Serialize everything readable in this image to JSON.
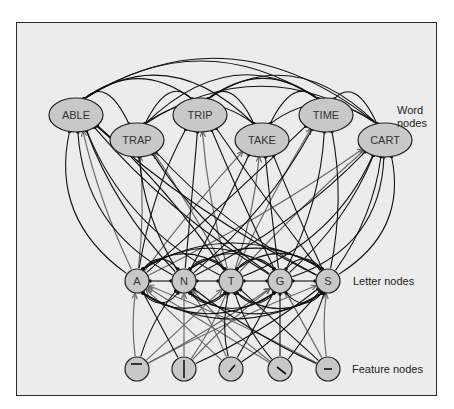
{
  "diagram": {
    "colors": {
      "background": "#ececec",
      "node_fill": "#c8c8c8",
      "excitatory": "#6a6a6a",
      "inhibitory": "#111111",
      "frame": "#2a2a2a"
    },
    "labels": {
      "word_nodes": "Word\nnodes",
      "word_line1": "Word",
      "word_line2": "nodes",
      "letter_nodes": "Letter nodes",
      "feature_nodes": "Feature nodes"
    },
    "word_nodes": [
      {
        "id": "ABLE",
        "label": "ABLE",
        "x": 76,
        "y": 115
      },
      {
        "id": "TRIP",
        "label": "TRIP",
        "x": 200,
        "y": 115
      },
      {
        "id": "TIME",
        "label": "TIME",
        "x": 326,
        "y": 115
      },
      {
        "id": "TRAP",
        "label": "TRAP",
        "x": 137,
        "y": 140
      },
      {
        "id": "TAKE",
        "label": "TAKE",
        "x": 262,
        "y": 140
      },
      {
        "id": "CART",
        "label": "CART",
        "x": 385,
        "y": 140
      }
    ],
    "letter_nodes": [
      {
        "id": "A",
        "label": "A",
        "x": 137,
        "y": 281
      },
      {
        "id": "N",
        "label": "N",
        "x": 184,
        "y": 281
      },
      {
        "id": "T",
        "label": "T",
        "x": 231,
        "y": 281
      },
      {
        "id": "G",
        "label": "G",
        "x": 280,
        "y": 281
      },
      {
        "id": "S",
        "label": "S",
        "x": 328,
        "y": 281
      }
    ],
    "feature_nodes": [
      {
        "id": "f1",
        "glyph": "horizontal-top",
        "x": 137,
        "y": 369
      },
      {
        "id": "f2",
        "glyph": "vertical",
        "x": 184,
        "y": 369
      },
      {
        "id": "f3",
        "glyph": "diagonal-right",
        "x": 231,
        "y": 369
      },
      {
        "id": "f4",
        "glyph": "diagonal-left",
        "x": 280,
        "y": 369
      },
      {
        "id": "f5",
        "glyph": "horizontal-middle",
        "x": 328,
        "y": 369
      }
    ],
    "connections": {
      "feature_to_letter_excitatory": [
        [
          "f1",
          "A"
        ],
        [
          "f1",
          "T"
        ],
        [
          "f1",
          "G"
        ],
        [
          "f1",
          "S"
        ],
        [
          "f2",
          "N"
        ],
        [
          "f2",
          "T"
        ],
        [
          "f2",
          "G"
        ],
        [
          "f3",
          "A"
        ],
        [
          "f3",
          "N"
        ],
        [
          "f4",
          "N"
        ],
        [
          "f4",
          "A"
        ],
        [
          "f5",
          "A"
        ],
        [
          "f5",
          "S"
        ],
        [
          "f5",
          "G"
        ]
      ],
      "feature_to_letter_inhibitory": [
        [
          "f1",
          "N"
        ],
        [
          "f2",
          "A"
        ],
        [
          "f2",
          "S"
        ],
        [
          "f3",
          "T"
        ],
        [
          "f3",
          "G"
        ],
        [
          "f3",
          "S"
        ],
        [
          "f4",
          "T"
        ],
        [
          "f4",
          "G"
        ],
        [
          "f4",
          "S"
        ],
        [
          "f5",
          "N"
        ],
        [
          "f5",
          "T"
        ]
      ],
      "letter_to_word_excitatory": [
        [
          "A",
          "ABLE"
        ],
        [
          "A",
          "TRAP"
        ],
        [
          "A",
          "TAKE"
        ],
        [
          "A",
          "CART"
        ],
        [
          "T",
          "TRIP"
        ],
        [
          "T",
          "TRAP"
        ],
        [
          "T",
          "TIME"
        ],
        [
          "T",
          "TAKE"
        ],
        [
          "T",
          "CART"
        ]
      ],
      "letter_to_word_inhibitory": [
        [
          "N",
          "ABLE"
        ],
        [
          "N",
          "TRIP"
        ],
        [
          "N",
          "TIME"
        ],
        [
          "N",
          "TRAP"
        ],
        [
          "N",
          "TAKE"
        ],
        [
          "N",
          "CART"
        ],
        [
          "G",
          "ABLE"
        ],
        [
          "G",
          "TRIP"
        ],
        [
          "G",
          "TIME"
        ],
        [
          "G",
          "TRAP"
        ],
        [
          "G",
          "TAKE"
        ],
        [
          "G",
          "CART"
        ],
        [
          "S",
          "ABLE"
        ],
        [
          "S",
          "TRIP"
        ],
        [
          "S",
          "TIME"
        ],
        [
          "S",
          "TRAP"
        ],
        [
          "S",
          "TAKE"
        ],
        [
          "S",
          "CART"
        ],
        [
          "A",
          "TRIP"
        ],
        [
          "A",
          "TIME"
        ],
        [
          "T",
          "ABLE"
        ]
      ]
    }
  }
}
